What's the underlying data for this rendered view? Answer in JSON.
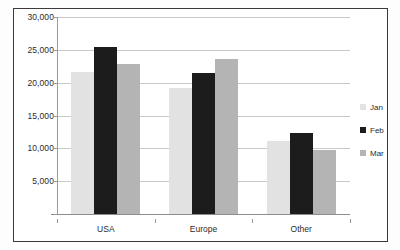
{
  "chart_data": {
    "type": "bar",
    "title": "",
    "subtitle": "",
    "xlabel": "",
    "ylabel": "",
    "categories": [
      "USA",
      "Europe",
      "Other"
    ],
    "series": [
      {
        "name": "Jan",
        "color": "#e2e2e2",
        "values": [
          21700,
          19200,
          11100
        ]
      },
      {
        "name": "Feb",
        "color": "#1c1c1c",
        "values": [
          25400,
          21500,
          12400
        ]
      },
      {
        "name": "Mar",
        "color": "#b4b4b4",
        "values": [
          22800,
          23600,
          9700
        ]
      }
    ],
    "ylim": [
      0,
      30000
    ],
    "yticks": [
      0,
      5000,
      10000,
      15000,
      20000,
      25000,
      30000
    ],
    "ytick_labels": [
      "-",
      "5,000",
      "10,000",
      "15,000",
      "20,000",
      "25,000",
      "30,000"
    ],
    "grid": true,
    "legend_position": "right"
  },
  "legend": {
    "items": [
      {
        "label": "Jan"
      },
      {
        "label": "Feb"
      },
      {
        "label": "Mar"
      }
    ]
  }
}
